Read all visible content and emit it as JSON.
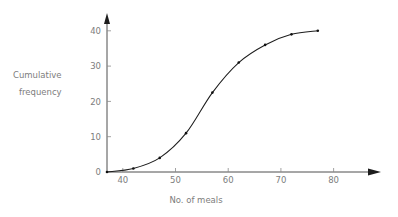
{
  "chart_data": {
    "type": "line",
    "title": "",
    "subtitle": "",
    "xlabel": "No. of meals",
    "ylabel_line1": "Cumulative",
    "ylabel_line2": "frequency",
    "ylabel": "Cumulative frequency",
    "xlim": [
      35,
      82
    ],
    "ylim": [
      0,
      43
    ],
    "xticks": [
      40,
      50,
      60,
      70,
      80
    ],
    "yticks": [
      0,
      10,
      20,
      30,
      40
    ],
    "xtick_labels": [
      "40",
      "50",
      "60",
      "70",
      "80"
    ],
    "ytick_labels": [
      "0",
      "10",
      "20",
      "30",
      "40"
    ],
    "grid": false,
    "legend": "none",
    "axis_arrows": true,
    "series": [
      {
        "name": "Cumulative frequency",
        "marker": "dot",
        "color": "#1d1d1d",
        "x": [
          37,
          42,
          47,
          52,
          57,
          62,
          67,
          72,
          77
        ],
        "y": [
          0,
          1,
          4,
          11,
          22.5,
          31,
          36,
          39,
          40
        ]
      }
    ],
    "points": [
      {
        "x": 37,
        "y": 0
      },
      {
        "x": 42,
        "y": 1
      },
      {
        "x": 47,
        "y": 4
      },
      {
        "x": 52,
        "y": 11
      },
      {
        "x": 57,
        "y": 22.5
      },
      {
        "x": 62,
        "y": 31
      },
      {
        "x": 67,
        "y": 36
      },
      {
        "x": 72,
        "y": 39
      },
      {
        "x": 77,
        "y": 40
      }
    ]
  },
  "geometry": {
    "origin_x": 107,
    "origin_y": 172,
    "x_per_unit": 5.27,
    "y_per_unit": 3.53,
    "x_axis_end": 380,
    "y_axis_top": 16
  }
}
